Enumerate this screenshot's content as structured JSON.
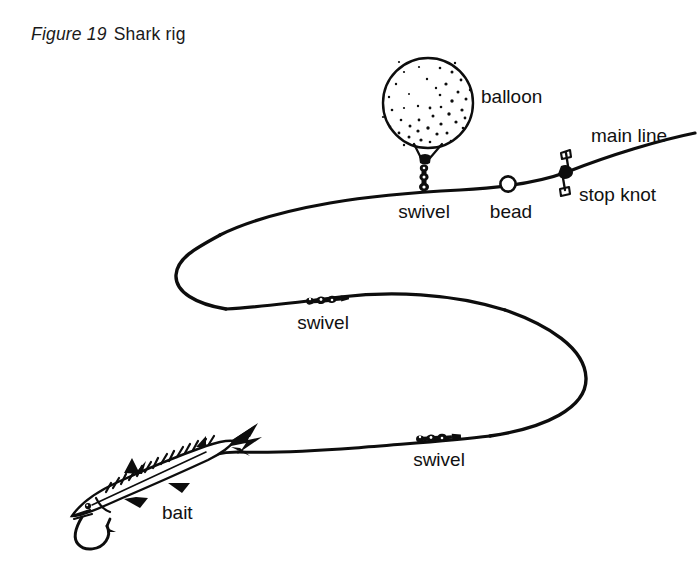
{
  "figure": {
    "number_label": "Figure 19",
    "title": "Shark rig",
    "type": "technical line illustration"
  },
  "canvas": {
    "width": 697,
    "height": 562,
    "background_color": "#ffffff",
    "ink_color": "#0d0d0d"
  },
  "labels": {
    "balloon": "balloon",
    "main_line": "main line",
    "stop_knot": "stop knot",
    "bead": "bead",
    "swivel_top": "swivel",
    "swivel_middle": "swivel",
    "swivel_lower": "swivel",
    "bait": "bait"
  },
  "components": [
    {
      "name": "balloon",
      "label": "balloon",
      "shape": "stippled circle float",
      "center": [
        428,
        103
      ],
      "radius": 45,
      "label_position": [
        481,
        103
      ],
      "shading": "stipple dots, densest lower-right, highlight upper-left"
    },
    {
      "name": "balloon-neck-swivel",
      "label": "swivel",
      "shape": "vertical stack of knot links",
      "position": [
        424,
        165
      ],
      "label_position": [
        424,
        218
      ]
    },
    {
      "name": "bead",
      "label": "bead",
      "shape": "hollow white circle on line",
      "position": [
        508,
        185
      ],
      "radius": 8,
      "label_position": [
        511,
        218
      ]
    },
    {
      "name": "stop-knot",
      "label": "stop knot",
      "shape": "knot with two flared tag ends",
      "position": [
        567,
        172
      ],
      "label_position": [
        579,
        200
      ]
    },
    {
      "name": "main-line-end",
      "label": "main line",
      "shape": "line exiting frame at upper right",
      "position": [
        690,
        136
      ],
      "label_position": [
        591,
        140
      ]
    },
    {
      "name": "swivel-middle",
      "label": "swivel",
      "shape": "inline chain of barrel links",
      "position": [
        324,
        300
      ],
      "label_position": [
        323,
        329
      ]
    },
    {
      "name": "swivel-lower",
      "label": "swivel",
      "shape": "inline chain of barrel links",
      "position": [
        434,
        435
      ],
      "label_position": [
        439,
        465
      ]
    },
    {
      "name": "bait-fish",
      "label": "bait",
      "shape": "mackerel with barred back, forked tail, hook through jaw",
      "position": [
        160,
        480
      ],
      "label_position": [
        162,
        519
      ]
    },
    {
      "name": "hook",
      "label": "",
      "shape": "J-hook with barb through lower jaw",
      "position": [
        95,
        520
      ]
    }
  ],
  "line_path": {
    "description": "continuous monofilament running from upper-right main line, left past stop knot, bead and balloon swivel, looping left, back right through middle swivel, looping right, then left to lower swivel and down to bait",
    "stroke_width": 3.2,
    "loops": [
      {
        "name": "left-u-turn",
        "extreme_point": [
          176,
          272
        ]
      },
      {
        "name": "right-u-turn",
        "extreme_point": [
          586,
          376
        ]
      }
    ]
  }
}
